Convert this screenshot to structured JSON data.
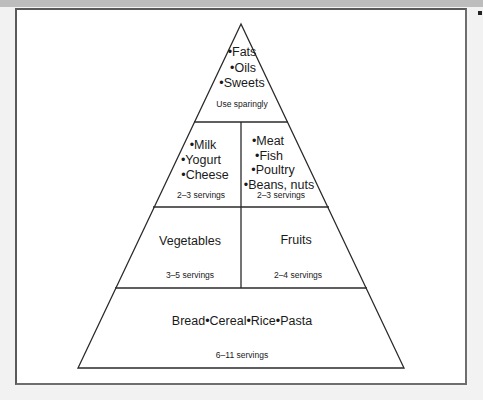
{
  "diagram": {
    "type": "pyramid",
    "tiers": [
      {
        "level": 1,
        "sections": [
          {
            "items": [
              "•Fats",
              "•Oils",
              "•Sweets"
            ],
            "servings": "Use sparingly"
          }
        ]
      },
      {
        "level": 2,
        "sections": [
          {
            "items": [
              "•Milk",
              "•Yogurt",
              "•Cheese"
            ],
            "servings": "2–3 servings"
          },
          {
            "items": [
              "•Meat",
              "•Fish",
              "•Poultry",
              "•Beans, nuts"
            ],
            "servings": "2–3 servings"
          }
        ]
      },
      {
        "level": 3,
        "sections": [
          {
            "items": [
              "Vegetables"
            ],
            "servings": "3–5 servings"
          },
          {
            "items": [
              "Fruits"
            ],
            "servings": "2–4 servings"
          }
        ]
      },
      {
        "level": 4,
        "sections": [
          {
            "items": [
              "Bread•Cereal•Rice•Pasta"
            ],
            "servings": "6–11 servings"
          }
        ]
      }
    ],
    "colors": {
      "line": "#2a2a2a",
      "background": "#ffffff",
      "frame": "#d4d4d4"
    }
  }
}
